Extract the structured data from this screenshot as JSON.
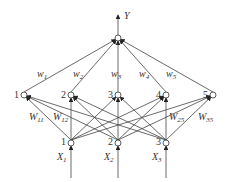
{
  "diagram": {
    "output": {
      "label": "Y",
      "x": 118,
      "y": 38
    },
    "hidden_nodes": [
      {
        "id": "1",
        "x": 24,
        "y": 95
      },
      {
        "id": "2",
        "x": 71,
        "y": 95
      },
      {
        "id": "3",
        "x": 118,
        "y": 95
      },
      {
        "id": "4",
        "x": 166,
        "y": 95
      },
      {
        "id": "5",
        "x": 213,
        "y": 95
      }
    ],
    "input_nodes": [
      {
        "id": "1",
        "label": "X",
        "sub": "1",
        "x": 71,
        "y": 143
      },
      {
        "id": "2",
        "label": "X",
        "sub": "2",
        "x": 118,
        "y": 143
      },
      {
        "id": "3",
        "label": "X",
        "sub": "3",
        "x": 166,
        "y": 143
      }
    ],
    "output_weights": [
      {
        "label": "w",
        "sub": "1"
      },
      {
        "label": "w",
        "sub": "2"
      },
      {
        "label": "w",
        "sub": "3"
      },
      {
        "label": "w",
        "sub": "4"
      },
      {
        "label": "w",
        "sub": "5"
      }
    ],
    "input_weights": [
      {
        "label": "W",
        "sub": "11"
      },
      {
        "label": "W",
        "sub": "12"
      },
      {
        "label": "W",
        "sub": "25"
      },
      {
        "label": "W",
        "sub": "35"
      }
    ]
  }
}
